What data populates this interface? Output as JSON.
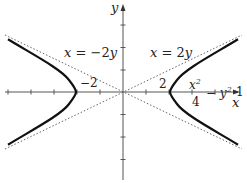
{
  "diagram": {
    "axes": {
      "x_label": "x",
      "y_label": "y",
      "origin_px": [
        123,
        92
      ],
      "unit_px": 23,
      "x_ticks": [
        -5,
        -4,
        -3,
        -2,
        -1,
        1,
        2,
        3,
        4,
        5
      ],
      "y_ticks": [
        -3,
        -2,
        -1,
        1,
        2,
        3
      ]
    },
    "tick_labels": {
      "neg_two": "−2",
      "pos_two": "2"
    },
    "asymptotes": [
      {
        "label_lhs": "x",
        "label_eq": " = −2",
        "label_var": "y",
        "equation": "x = -2y",
        "style": "dotted"
      },
      {
        "label_lhs": "x",
        "label_eq": " = 2",
        "label_var": "y",
        "equation": "x = 2y",
        "style": "dotted"
      }
    ],
    "curve": {
      "equation": "x^2/4 - y^2 = 1",
      "numerator": "x",
      "numerator_exp": "2",
      "denominator": "4",
      "minus_term": "− y",
      "minus_exp": "2",
      "rhs": "= 1",
      "vertices": [
        [
          -2,
          0
        ],
        [
          2,
          0
        ]
      ],
      "style": "solid-bold"
    },
    "colors": {
      "axis": "#555555",
      "curve": "#111111",
      "asymptote": "#666666",
      "text": "#222222"
    }
  }
}
